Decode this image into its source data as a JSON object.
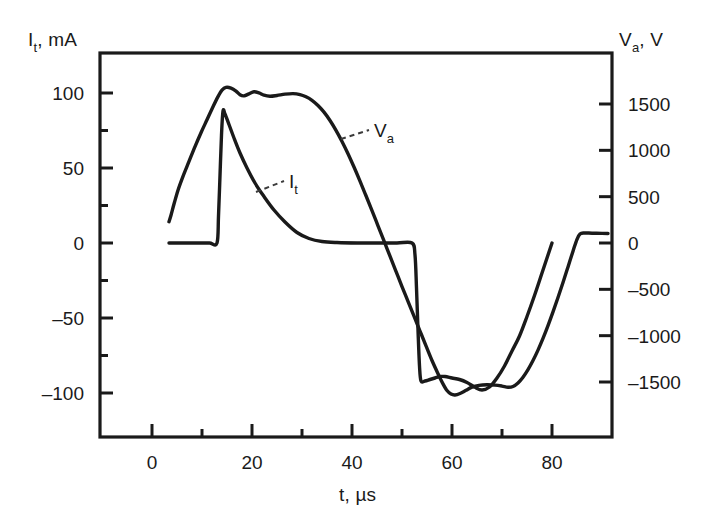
{
  "chart_data": {
    "type": "line",
    "title": "",
    "xlabel": "t, µs",
    "ylabel_left": "I_t, mA",
    "ylabel_right": "V_a, V",
    "xlim": [
      -10,
      92
    ],
    "ylim_left": [
      -125,
      128
    ],
    "ylim_right": [
      -1870,
      1920
    ],
    "grid": false,
    "legend": "inline-annotations",
    "xticks_major": [
      0,
      20,
      40,
      60,
      80
    ],
    "xticks_major_labels": [
      "0",
      "20",
      "40",
      "60",
      "80"
    ],
    "xticks_minor": [
      10,
      30,
      50,
      70
    ],
    "yticks_left_major": [
      100,
      50,
      0,
      -50,
      -100
    ],
    "yticks_left_major_labels": [
      "100",
      "50",
      "0",
      "–50",
      "–100"
    ],
    "yticks_left_minor": [
      75,
      25,
      -25,
      -75
    ],
    "yticks_right_major": [
      1500,
      1000,
      500,
      0,
      -500,
      -1000,
      -1500
    ],
    "yticks_right_major_labels": [
      "1500",
      "1000",
      "500",
      "0",
      "–500",
      "–1000",
      "–1500"
    ],
    "series": [
      {
        "name": "I_t",
        "axis": "left",
        "units": "mA",
        "annotation": "I_t",
        "annotation_at": [
          23.5,
          36
        ],
        "points": [
          [
            3.4,
            0
          ],
          [
            6,
            0
          ],
          [
            9,
            0
          ],
          [
            11.5,
            0
          ],
          [
            13.0,
            0
          ],
          [
            13.3,
            18
          ],
          [
            13.6,
            45
          ],
          [
            13.9,
            72
          ],
          [
            14.2,
            88
          ],
          [
            14.6,
            86
          ],
          [
            15.4,
            79
          ],
          [
            16.4,
            70
          ],
          [
            17.6,
            60
          ],
          [
            19.0,
            50
          ],
          [
            20.6,
            40
          ],
          [
            22.4,
            31
          ],
          [
            24.4,
            22
          ],
          [
            26.6,
            14
          ],
          [
            29.0,
            7
          ],
          [
            31.4,
            3
          ],
          [
            34.0,
            1
          ],
          [
            37.0,
            0.3
          ],
          [
            41.0,
            0
          ],
          [
            45.0,
            0
          ],
          [
            49.0,
            0
          ],
          [
            52.0,
            0
          ],
          [
            52.6,
            -8
          ],
          [
            52.9,
            -30
          ],
          [
            53.2,
            -58
          ],
          [
            53.5,
            -82
          ],
          [
            53.8,
            -92
          ],
          [
            54.6,
            -92
          ],
          [
            55.6,
            -91
          ],
          [
            56.6,
            -90
          ],
          [
            57.6,
            -89
          ],
          [
            58.6,
            -89
          ],
          [
            60.0,
            -90
          ],
          [
            61.5,
            -91
          ],
          [
            63.0,
            -93
          ],
          [
            64.5,
            -96
          ],
          [
            66.0,
            -98
          ],
          [
            67.5,
            -96
          ],
          [
            69.0,
            -90
          ],
          [
            70.5,
            -82
          ],
          [
            72.0,
            -72
          ],
          [
            73.5,
            -62
          ],
          [
            75.0,
            -49
          ],
          [
            76.5,
            -35
          ],
          [
            78.0,
            -20
          ],
          [
            79.2,
            -8
          ],
          [
            80.0,
            0
          ]
        ]
      },
      {
        "name": "V_a",
        "axis": "right",
        "units": "V",
        "annotation": "V_a",
        "annotation_at": [
          44.5,
          1360
        ],
        "points": [
          [
            3.4,
            230
          ],
          [
            3.8,
            300
          ],
          [
            4.4,
            420
          ],
          [
            5.2,
            570
          ],
          [
            6.2,
            720
          ],
          [
            7.4,
            880
          ],
          [
            8.6,
            1040
          ],
          [
            9.8,
            1190
          ],
          [
            11.0,
            1330
          ],
          [
            12.2,
            1470
          ],
          [
            13.2,
            1580
          ],
          [
            14.0,
            1650
          ],
          [
            14.8,
            1680
          ],
          [
            15.8,
            1672
          ],
          [
            16.8,
            1640
          ],
          [
            17.6,
            1600
          ],
          [
            18.4,
            1588
          ],
          [
            19.4,
            1610
          ],
          [
            20.4,
            1632
          ],
          [
            21.4,
            1620
          ],
          [
            22.4,
            1596
          ],
          [
            23.6,
            1584
          ],
          [
            25.0,
            1592
          ],
          [
            26.6,
            1606
          ],
          [
            28.2,
            1612
          ],
          [
            29.6,
            1602
          ],
          [
            30.8,
            1578
          ],
          [
            32.0,
            1540
          ],
          [
            33.2,
            1484
          ],
          [
            34.4,
            1412
          ],
          [
            35.6,
            1322
          ],
          [
            36.8,
            1216
          ],
          [
            38.0,
            1096
          ],
          [
            39.2,
            964
          ],
          [
            40.4,
            820
          ],
          [
            41.6,
            668
          ],
          [
            42.8,
            510
          ],
          [
            44.0,
            350
          ],
          [
            45.2,
            186
          ],
          [
            46.4,
            22
          ],
          [
            47.6,
            -142
          ],
          [
            48.8,
            -306
          ],
          [
            50.0,
            -470
          ],
          [
            51.2,
            -630
          ],
          [
            52.4,
            -790
          ],
          [
            53.6,
            -950
          ],
          [
            54.8,
            -1110
          ],
          [
            56.0,
            -1268
          ],
          [
            57.2,
            -1410
          ],
          [
            58.2,
            -1520
          ],
          [
            59.0,
            -1592
          ],
          [
            59.8,
            -1630
          ],
          [
            60.6,
            -1640
          ],
          [
            61.6,
            -1624
          ],
          [
            62.8,
            -1590
          ],
          [
            64.0,
            -1556
          ],
          [
            65.4,
            -1536
          ],
          [
            67.0,
            -1530
          ],
          [
            68.6,
            -1534
          ],
          [
            70.0,
            -1544
          ],
          [
            71.2,
            -1556
          ],
          [
            72.2,
            -1548
          ],
          [
            73.2,
            -1510
          ],
          [
            74.2,
            -1448
          ],
          [
            75.2,
            -1366
          ],
          [
            76.2,
            -1268
          ],
          [
            77.2,
            -1156
          ],
          [
            78.2,
            -1030
          ],
          [
            79.2,
            -892
          ],
          [
            80.2,
            -744
          ],
          [
            81.2,
            -588
          ],
          [
            82.2,
            -426
          ],
          [
            83.2,
            -258
          ],
          [
            84.2,
            -88
          ],
          [
            85.0,
            40
          ],
          [
            85.6,
            96
          ],
          [
            86.4,
            108
          ],
          [
            88.0,
            106
          ],
          [
            90.0,
            104
          ],
          [
            91.2,
            103
          ]
        ]
      }
    ]
  },
  "axes": {
    "left_title": "I",
    "left_title_sub": "t",
    "left_title_unit": ", mA",
    "right_title": "V",
    "right_title_sub": "a",
    "right_title_unit": ", V",
    "x_title": "t",
    "x_title_unit": ", µs"
  },
  "annotations": {
    "current_label": "I",
    "current_label_sub": "t",
    "voltage_label": "V",
    "voltage_label_sub": "a"
  },
  "style": {
    "line_color": "#1a1a1a",
    "frame_color": "#1a1a1a",
    "background": "#ffffff",
    "leader_color": "#3b3b3b"
  }
}
